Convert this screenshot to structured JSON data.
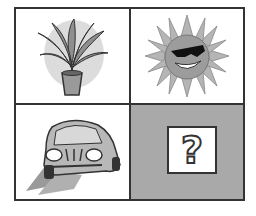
{
  "puzzle": {
    "type": "2x2 picture grid",
    "cells": [
      {
        "position": "top-left",
        "content": "potted-plant",
        "label": "Potted plant"
      },
      {
        "position": "top-right",
        "content": "sun-with-sunglasses",
        "label": "Smiling sun wearing sunglasses"
      },
      {
        "position": "bottom-left",
        "content": "car",
        "label": "Cartoon car"
      },
      {
        "position": "bottom-right",
        "content": "question-mark",
        "label": "?"
      }
    ],
    "question_mark": "?"
  },
  "colors": {
    "border": "#333333",
    "cell_background": "#ffffff",
    "unknown_cell_background": "#a9a9a9",
    "illustration_gray": "#8a8a8a"
  }
}
